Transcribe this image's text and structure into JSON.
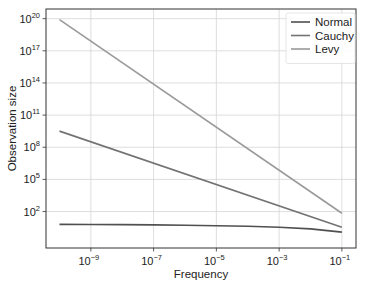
{
  "chart_data": {
    "type": "line",
    "title": "",
    "xlabel": "Frequency",
    "ylabel": "Observation size",
    "xscale": "log",
    "yscale": "log",
    "xlim_log10": [
      -10.43,
      -0.55
    ],
    "ylim_log10": [
      -1.4,
      20.9
    ],
    "xticks_log10": [
      -9,
      -7,
      -5,
      -3,
      -1
    ],
    "yticks_log10": [
      2,
      5,
      8,
      11,
      14,
      17,
      20
    ],
    "tick_base": "10",
    "grid": true,
    "legend": "top-right",
    "series": [
      {
        "name": "Normal",
        "color": "#505050",
        "x": [
          1e-10,
          1e-09,
          1e-08,
          1e-07,
          1e-06,
          1e-05,
          0.0001,
          0.001,
          0.01,
          0.1
        ],
        "y": [
          6.4,
          6.2,
          6.0,
          5.7,
          5.3,
          4.8,
          4.2,
          3.4,
          2.4,
          1.2
        ]
      },
      {
        "name": "Cauchy",
        "color": "#737373",
        "x": [
          1e-10,
          0.1
        ],
        "y": [
          3200000000.0,
          3.5
        ]
      },
      {
        "name": "Levy",
        "color": "#9a9a9a",
        "x": [
          1e-10,
          0.1
        ],
        "y": [
          8e+19,
          70
        ]
      }
    ]
  }
}
